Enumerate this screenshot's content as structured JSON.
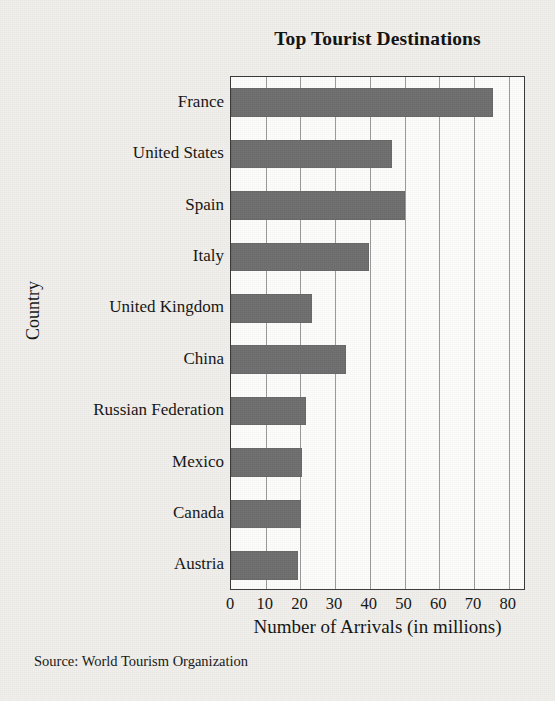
{
  "figure": {
    "background_color": "#f0efeb",
    "plot_background_color": "#fdfdfc",
    "bar_color": "#6e6e6e",
    "axis_color": "#3a3a3a",
    "grid_color": "#9a9a9a"
  },
  "source_note": "Source: World Tourism Organization",
  "chart_data": {
    "type": "bar",
    "orientation": "horizontal",
    "title": "Top Tourist Destinations",
    "xlabel": "Number of Arrivals (in millions)",
    "ylabel": "Country",
    "categories": [
      "France",
      "United States",
      "Spain",
      "Italy",
      "United Kingdom",
      "China",
      "Russian Federation",
      "Mexico",
      "Canada",
      "Austria"
    ],
    "values": [
      75.5,
      46.4,
      50.0,
      39.8,
      23.4,
      33.2,
      21.5,
      20.6,
      20.1,
      19.4
    ],
    "xlim": [
      0,
      85
    ],
    "xticks": [
      0,
      10,
      20,
      30,
      40,
      50,
      60,
      70,
      80
    ],
    "xtick_labels": [
      "0",
      "10",
      "20",
      "30",
      "40",
      "50",
      "60",
      "70",
      "80"
    ],
    "grid": "vertical",
    "legend": "none"
  }
}
